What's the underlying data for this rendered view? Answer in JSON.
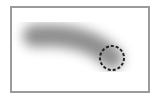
{
  "canvas": {
    "frame_color": "#9a9a9a",
    "background": "#ffffff"
  },
  "stroke": {
    "color": "#7a7a7a",
    "blur": 6,
    "width": 22
  },
  "cursor": {
    "shape": "dashed-circle",
    "color": "#222222",
    "radius": 12
  }
}
